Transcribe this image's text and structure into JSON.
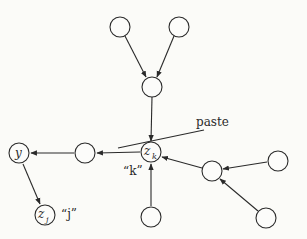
{
  "diagram": {
    "type": "directed-graph",
    "nodes": [
      {
        "id": "n_top_left",
        "label": "",
        "x": 120,
        "y": 27
      },
      {
        "id": "n_top_right",
        "label": "",
        "x": 179,
        "y": 27
      },
      {
        "id": "n_mid_top",
        "label": "",
        "x": 152,
        "y": 87
      },
      {
        "id": "zk",
        "label": "z",
        "sub": "k",
        "x": 151,
        "y": 152
      },
      {
        "id": "n_left",
        "label": "",
        "x": 85,
        "y": 153
      },
      {
        "id": "y",
        "label": "y",
        "x": 19,
        "y": 153
      },
      {
        "id": "zj",
        "label": "z",
        "sub": "j",
        "x": 45,
        "y": 215
      },
      {
        "id": "n_bottom",
        "label": "",
        "x": 151,
        "y": 217
      },
      {
        "id": "n_right_mid",
        "label": "",
        "x": 212,
        "y": 171
      },
      {
        "id": "n_far_right_upper",
        "label": "",
        "x": 278,
        "y": 161
      },
      {
        "id": "n_far_right_lower",
        "label": "",
        "x": 266,
        "y": 218
      }
    ],
    "edges": [
      {
        "from": "n_top_left",
        "to": "n_mid_top"
      },
      {
        "from": "n_top_right",
        "to": "n_mid_top"
      },
      {
        "from": "n_mid_top",
        "to": "zk"
      },
      {
        "from": "zk",
        "to": "n_left"
      },
      {
        "from": "n_left",
        "to": "y"
      },
      {
        "from": "y",
        "to": "zj"
      },
      {
        "from": "n_bottom",
        "to": "zk"
      },
      {
        "from": "n_right_mid",
        "to": "zk"
      },
      {
        "from": "n_far_right_upper",
        "to": "n_right_mid"
      },
      {
        "from": "n_far_right_lower",
        "to": "n_right_mid"
      }
    ],
    "labels": {
      "paste": "paste",
      "k_quote": "“k”",
      "j_quote": "“j”",
      "y_node": "y",
      "zk_main": "z",
      "zk_sub": "k",
      "zj_main": "z",
      "zj_sub": "j"
    },
    "colors": {
      "stroke": "#2a2a2a",
      "background": "#fbfbf8"
    }
  }
}
